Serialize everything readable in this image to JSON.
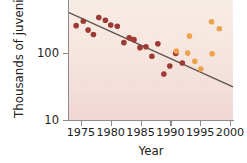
{
  "chart_data": {
    "type": "scatter",
    "title": "",
    "xlabel": "Year",
    "ylabel": "Thousands of juveniles",
    "xlim": [
      1973,
      2000.5
    ],
    "ylim": [
      10,
      600
    ],
    "yscale": "log",
    "grid": false,
    "legend": "none",
    "xticks": [
      1975,
      1980,
      1985,
      1990,
      1995,
      2000
    ],
    "xticklabels": [
      "1975",
      "1980",
      "1985",
      "1990",
      "1995",
      "2000"
    ],
    "yticks": [
      10,
      100
    ],
    "yticklabels": [
      "10",
      "100"
    ],
    "series": [
      {
        "name": "early-period-dark",
        "color": "#9c3a33",
        "points": [
          {
            "x": 1974.2,
            "y": 250
          },
          {
            "x": 1975.4,
            "y": 290
          },
          {
            "x": 1976.2,
            "y": 215
          },
          {
            "x": 1977.1,
            "y": 185
          },
          {
            "x": 1978.0,
            "y": 330
          },
          {
            "x": 1979.1,
            "y": 300
          },
          {
            "x": 1980.0,
            "y": 255
          },
          {
            "x": 1981.1,
            "y": 245
          },
          {
            "x": 1982.2,
            "y": 140
          },
          {
            "x": 1983.1,
            "y": 165
          },
          {
            "x": 1983.9,
            "y": 155
          },
          {
            "x": 1984.9,
            "y": 118
          },
          {
            "x": 1985.9,
            "y": 122
          },
          {
            "x": 1986.9,
            "y": 88
          },
          {
            "x": 1987.9,
            "y": 135
          },
          {
            "x": 1988.9,
            "y": 48
          },
          {
            "x": 1989.9,
            "y": 63
          },
          {
            "x": 1990.9,
            "y": 97
          },
          {
            "x": 1992.0,
            "y": 70
          }
        ]
      },
      {
        "name": "late-period-light",
        "color": "#eda24e",
        "points": [
          {
            "x": 1991.0,
            "y": 105
          },
          {
            "x": 1992.9,
            "y": 98
          },
          {
            "x": 1993.2,
            "y": 175
          },
          {
            "x": 1994.1,
            "y": 74
          },
          {
            "x": 1995.1,
            "y": 57
          },
          {
            "x": 1996.9,
            "y": 285
          },
          {
            "x": 1997.0,
            "y": 96
          },
          {
            "x": 1998.2,
            "y": 225
          }
        ]
      }
    ],
    "trendline": {
      "name": "linear-regression-log",
      "color": "#5b544d",
      "x_start": 1973.0,
      "x_end": 2000.5,
      "y_start": 390,
      "y_end": 31
    }
  }
}
